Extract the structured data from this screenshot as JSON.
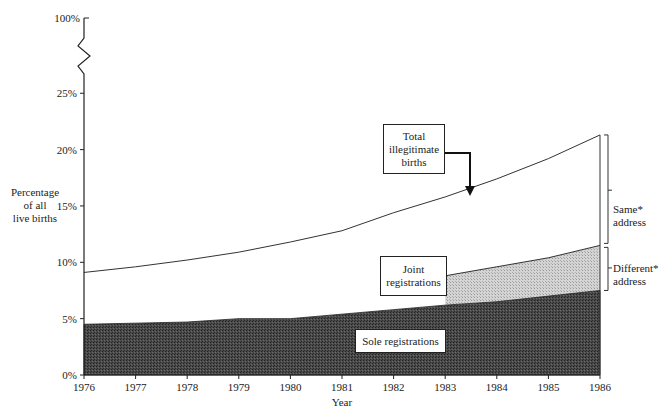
{
  "chart_data": {
    "type": "area",
    "title": "",
    "xlabel": "Year",
    "ylabel": "Percentage of all live births",
    "x": [
      1976,
      1977,
      1978,
      1979,
      1980,
      1981,
      1982,
      1983,
      1984,
      1985,
      1986
    ],
    "yticks": [
      "0%",
      "5%",
      "10%",
      "15%",
      "20%",
      "25%",
      "100%"
    ],
    "ylim": [
      0,
      100
    ],
    "axis_break": "between 25% and 100%",
    "series": [
      {
        "name": "Sole registrations",
        "style": "dark stippled fill",
        "values": [
          4.5,
          4.6,
          4.7,
          5.0,
          5.0,
          5.4,
          5.8,
          6.2,
          6.5,
          7.0,
          7.5
        ]
      },
      {
        "name": "Joint registrations (different address)",
        "style": "light stippled fill, stacked on sole, shown from 1983",
        "values": [
          null,
          null,
          null,
          null,
          null,
          null,
          null,
          8.8,
          9.6,
          10.4,
          11.5
        ]
      },
      {
        "name": "Total illegitimate births",
        "style": "line",
        "values": [
          9.1,
          9.6,
          10.2,
          10.9,
          11.8,
          12.8,
          14.4,
          15.8,
          17.4,
          19.2,
          21.3
        ]
      }
    ],
    "annotations": [
      "Total illegitimate births",
      "Joint registrations",
      "Sole registrations",
      "Same* address",
      "Different* address"
    ],
    "grid": false,
    "legend": "inline boxed labels"
  },
  "labels": {
    "ylabel_lines": [
      "Percentage",
      "of all",
      "live births"
    ],
    "xlabel": "Year",
    "total_box": [
      "Total",
      "illegitimate",
      "births"
    ],
    "joint_box": [
      "Joint",
      "registrations"
    ],
    "sole_box": "Sole registrations",
    "same_address": [
      "Same*",
      "address"
    ],
    "different_address": [
      "Different*",
      "address"
    ]
  },
  "colors": {
    "sole_fill": "#3a3a3a",
    "joint_fill": "#c8c8c8",
    "line": "#333333"
  }
}
